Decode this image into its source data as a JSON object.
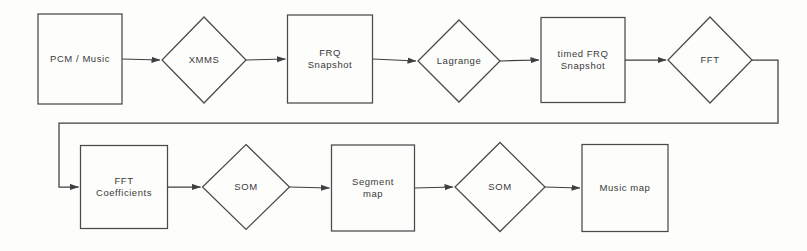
{
  "diagram": {
    "type": "flowchart",
    "background_color": "#fdfdfc",
    "stroke_color": "#4a4a4a",
    "text_color": "#3a3a3a",
    "nodes": [
      {
        "id": "pcm_music",
        "label": "PCM / Music",
        "shape": "rect",
        "row": 1,
        "cx": 80,
        "cy": 59,
        "w": 84,
        "h": 90
      },
      {
        "id": "xmms",
        "label": "XMMS",
        "shape": "diamond",
        "row": 1,
        "cx": 204,
        "cy": 60,
        "w": 84,
        "h": 86
      },
      {
        "id": "frq_snapshot",
        "label": "FRQ\nSnapshot",
        "shape": "rect",
        "row": 1,
        "cx": 330,
        "cy": 59,
        "w": 85,
        "h": 88
      },
      {
        "id": "lagrange",
        "label": "Lagrange",
        "shape": "diamond",
        "row": 1,
        "cx": 459,
        "cy": 61,
        "w": 82,
        "h": 82
      },
      {
        "id": "timed_frq",
        "label": "timed FRQ\nSnapshot",
        "shape": "rect",
        "row": 1,
        "cx": 583,
        "cy": 60,
        "w": 84,
        "h": 85
      },
      {
        "id": "fft",
        "label": "FFT",
        "shape": "diamond",
        "row": 1,
        "cx": 710,
        "cy": 60,
        "w": 84,
        "h": 86
      },
      {
        "id": "fft_coefficients",
        "label": "FFT\nCoefficients",
        "shape": "rect",
        "row": 2,
        "cx": 124,
        "cy": 187,
        "w": 87,
        "h": 83
      },
      {
        "id": "som_1",
        "label": "SOM",
        "shape": "diamond",
        "row": 2,
        "cx": 246,
        "cy": 187,
        "w": 87,
        "h": 85
      },
      {
        "id": "segment_map",
        "label": "Segment\nmap",
        "shape": "rect",
        "row": 2,
        "cx": 373,
        "cy": 188,
        "w": 83,
        "h": 86
      },
      {
        "id": "som_2",
        "label": "SOM",
        "shape": "diamond",
        "row": 2,
        "cx": 500,
        "cy": 187,
        "w": 90,
        "h": 89
      },
      {
        "id": "music_map",
        "label": "Music map",
        "shape": "rect",
        "row": 2,
        "cx": 625,
        "cy": 188,
        "w": 86,
        "h": 87
      }
    ],
    "edges": [
      {
        "from": "pcm_music",
        "to": "xmms",
        "kind": "straight"
      },
      {
        "from": "xmms",
        "to": "frq_snapshot",
        "kind": "straight"
      },
      {
        "from": "frq_snapshot",
        "to": "lagrange",
        "kind": "straight"
      },
      {
        "from": "lagrange",
        "to": "timed_frq",
        "kind": "straight"
      },
      {
        "from": "timed_frq",
        "to": "fft",
        "kind": "straight"
      },
      {
        "from": "fft",
        "to": "fft_coefficients",
        "kind": "wrap"
      },
      {
        "from": "fft_coefficients",
        "to": "som_1",
        "kind": "straight"
      },
      {
        "from": "som_1",
        "to": "segment_map",
        "kind": "straight"
      },
      {
        "from": "segment_map",
        "to": "som_2",
        "kind": "straight"
      },
      {
        "from": "som_2",
        "to": "music_map",
        "kind": "straight"
      }
    ]
  }
}
